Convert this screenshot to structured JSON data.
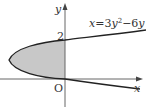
{
  "diagram": {
    "curve_label": "x=3y²−6y",
    "curve_label_parts": {
      "x": "x",
      "eq": "=3",
      "y1": "y",
      "sup": "2",
      "minus": "−6",
      "y2": "y"
    },
    "y_intercept_label": "2",
    "origin_label": "O",
    "x_axis_label": "x",
    "y_axis_label": "y",
    "colors": {
      "fill": "#c8c8c8",
      "stroke": "#222222",
      "axis": "#555555"
    }
  }
}
